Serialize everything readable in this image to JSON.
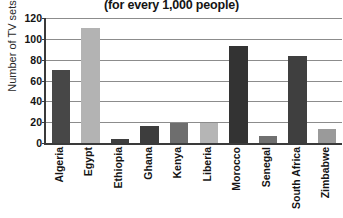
{
  "chart_data": {
    "type": "bar",
    "title": "(for every 1,000 people)",
    "subtitle": "",
    "xlabel": "",
    "ylabel": "Number of TV sets",
    "ylim": [
      0,
      120
    ],
    "yticks": [
      0,
      20,
      40,
      60,
      80,
      100,
      120
    ],
    "grid": true,
    "legend": "none",
    "categories": [
      "Algeria",
      "Egypt",
      "Ethiopia",
      "Ghana",
      "Kenya",
      "Liberia",
      "Morocco",
      "Senegal",
      "South Africa",
      "Zimbabwe"
    ],
    "values": [
      70,
      110,
      4,
      16,
      19,
      19,
      93,
      7,
      84,
      13
    ],
    "bar_colors": [
      "#474747",
      "#b3b3b3",
      "#3f3f3f",
      "#3d3d3d",
      "#6e6e6e",
      "#b5b5b5",
      "#333333",
      "#707070",
      "#3f3f3f",
      "#9a9a9a"
    ]
  },
  "axis": {
    "y_tick_labels": [
      "0",
      "20",
      "40",
      "60",
      "80",
      "100",
      "120"
    ],
    "y_title": "Number of TV sets"
  },
  "colors": {
    "axis_line": "#3a3a3a",
    "gridline": "#8c8c8c",
    "text": "#141414",
    "background": "#ffffff"
  }
}
